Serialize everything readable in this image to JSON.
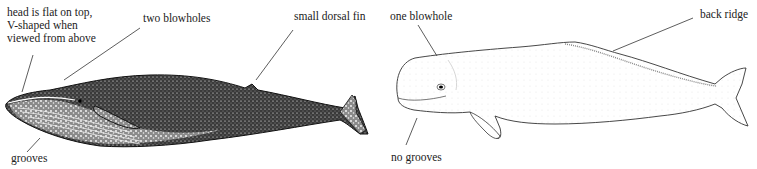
{
  "figure": {
    "left_panel": {
      "subject": "baleen whale",
      "labels": {
        "head": "head is flat on top,\nV-shaped when\nviewed from above",
        "blowholes": "two blowholes",
        "dorsal_fin": "small dorsal fin",
        "grooves": "grooves"
      }
    },
    "right_panel": {
      "subject": "toothed whale (beluga)",
      "labels": {
        "blowhole": "one blowhole",
        "back_ridge": "back ridge",
        "grooves": "no grooves"
      }
    },
    "colors": {
      "ink": "#111111",
      "text": "#222222",
      "background": "#ffffff"
    }
  }
}
